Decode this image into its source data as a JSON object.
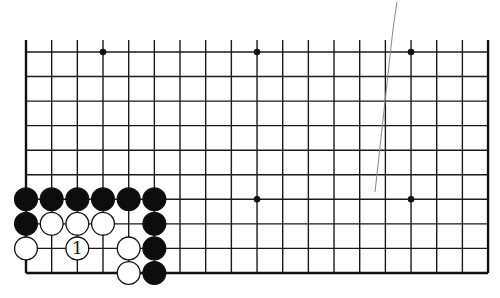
{
  "diagram": {
    "type": "go-board-partial",
    "board": {
      "columns": 19,
      "rows_shown": 10,
      "open_edge": "top",
      "closed_edges": [
        "left",
        "right",
        "bottom"
      ],
      "origin_x": 26,
      "origin_y": 52,
      "col_spacing": 25.67,
      "row_spacing": 24.55,
      "top_stub_y": 40,
      "line_color": "#1a1a1a",
      "edge_color": "#111111"
    },
    "star_points": [
      {
        "col": 3,
        "row": 0
      },
      {
        "col": 9,
        "row": 0
      },
      {
        "col": 15,
        "row": 0
      },
      {
        "col": 9,
        "row": 6
      },
      {
        "col": 15,
        "row": 6
      }
    ],
    "stones": [
      {
        "color": "black",
        "col": 0,
        "row": 6
      },
      {
        "color": "black",
        "col": 1,
        "row": 6
      },
      {
        "color": "black",
        "col": 2,
        "row": 6
      },
      {
        "color": "black",
        "col": 3,
        "row": 6
      },
      {
        "color": "black",
        "col": 4,
        "row": 6
      },
      {
        "color": "black",
        "col": 5,
        "row": 6
      },
      {
        "color": "black",
        "col": 0,
        "row": 7
      },
      {
        "color": "white",
        "col": 1,
        "row": 7
      },
      {
        "color": "white",
        "col": 2,
        "row": 7
      },
      {
        "color": "white",
        "col": 3,
        "row": 7
      },
      {
        "color": "black",
        "col": 5,
        "row": 7
      },
      {
        "color": "white",
        "col": 0,
        "row": 8
      },
      {
        "color": "white",
        "col": 2,
        "row": 8,
        "label": "1"
      },
      {
        "color": "white",
        "col": 4,
        "row": 8
      },
      {
        "color": "black",
        "col": 5,
        "row": 8
      },
      {
        "color": "white",
        "col": 4,
        "row": 9
      },
      {
        "color": "black",
        "col": 5,
        "row": 9
      }
    ],
    "move_label": "1",
    "stray_line": {
      "points": [
        [
          397,
          2
        ],
        [
          393,
          28
        ],
        [
          375,
          192
        ]
      ],
      "color": "#888888"
    }
  }
}
